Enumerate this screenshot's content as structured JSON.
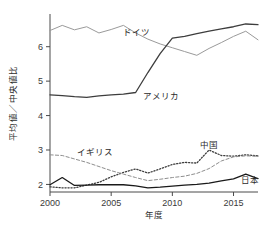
{
  "chart_data": {
    "type": "line",
    "title": "",
    "xlabel": "年度",
    "ylabel": "平均値／中央値比",
    "xlim": [
      2000,
      2017
    ],
    "ylim": [
      1.78,
      6.95
    ],
    "grid": false,
    "legend": "inline-labels",
    "xticks": [
      2000,
      2005,
      2010,
      2015
    ],
    "yticks": [
      2,
      3,
      4,
      5,
      6
    ],
    "x": [
      2000,
      2001,
      2002,
      2003,
      2004,
      2005,
      2006,
      2007,
      2008,
      2009,
      2010,
      2011,
      2012,
      2013,
      2014,
      2015,
      2016,
      2017
    ],
    "series": [
      {
        "name": "ドイツ",
        "style": "solid-gray",
        "color": "#9a9a9a",
        "label_x": 2006.0,
        "label_y": 6.33,
        "values": [
          6.47,
          6.62,
          6.49,
          6.58,
          6.4,
          6.5,
          6.62,
          6.4,
          6.22,
          6.08,
          5.97,
          5.86,
          5.75,
          5.95,
          6.12,
          6.3,
          6.45,
          6.2
        ]
      },
      {
        "name": "アメリカ",
        "style": "solid-dark",
        "color": "#3d3d3d",
        "label_x": 2007.6,
        "label_y": 4.47,
        "values": [
          4.6,
          4.58,
          4.55,
          4.53,
          4.57,
          4.6,
          4.62,
          4.67,
          5.25,
          5.8,
          6.25,
          6.3,
          6.38,
          6.45,
          6.52,
          6.58,
          6.66,
          6.64
        ]
      },
      {
        "name": "中国",
        "style": "dotted",
        "color": "#3d3d3d",
        "label_x": 2012.3,
        "label_y": 3.05,
        "values": [
          1.93,
          1.9,
          1.9,
          1.98,
          2.06,
          2.22,
          2.35,
          2.45,
          2.33,
          2.45,
          2.58,
          2.64,
          2.62,
          3.0,
          2.84,
          2.82,
          2.86,
          2.83
        ]
      },
      {
        "name": "イギリス",
        "style": "dashed",
        "color": "#8e8e8e",
        "label_x": 2002.2,
        "label_y": 2.86,
        "values": [
          2.86,
          2.84,
          2.74,
          2.64,
          2.52,
          2.4,
          2.3,
          2.2,
          2.11,
          2.15,
          2.2,
          2.24,
          2.32,
          2.46,
          2.68,
          2.8,
          2.83,
          2.82
        ]
      },
      {
        "name": "日本",
        "style": "solid-black",
        "color": "#1a1a1a",
        "label_x": 2015.6,
        "label_y": 2.03,
        "values": [
          1.99,
          2.2,
          1.97,
          1.98,
          1.99,
          1.99,
          1.99,
          1.96,
          1.9,
          1.92,
          1.95,
          1.98,
          2.0,
          2.04,
          2.1,
          2.16,
          2.3,
          2.17
        ]
      }
    ]
  }
}
